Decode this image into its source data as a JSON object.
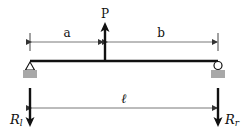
{
  "figure": {
    "type": "simply-supported-beam-point-load",
    "labels": {
      "load": "P",
      "dim_left": "a",
      "dim_right": "b",
      "span": "ℓ",
      "reaction_left_main": "R",
      "reaction_left_sub": "l",
      "reaction_right_main": "R",
      "reaction_right_sub": "r"
    },
    "colors": {
      "line": "#111111",
      "dim_line": "#555555",
      "support_base": "#a8a8a8",
      "background": "#ffffff"
    }
  }
}
